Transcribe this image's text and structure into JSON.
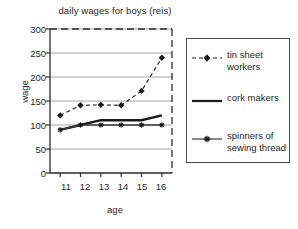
{
  "chart_data": {
    "type": "line",
    "title": "daily wages for boys (reis)",
    "xlabel": "age",
    "ylabel": "wage",
    "x": [
      11,
      12,
      13,
      14,
      15,
      16
    ],
    "xticklabels": [
      "11",
      "12",
      "13",
      "14",
      "15",
      "16"
    ],
    "yticklabels": [
      "0",
      "50",
      "100",
      "150",
      "200",
      "250",
      "300"
    ],
    "yticks": [
      0,
      50,
      100,
      150,
      200,
      250,
      300
    ],
    "xlim": [
      10.5,
      16.5
    ],
    "ylim": [
      0,
      300
    ],
    "grid": "horizontal",
    "legend_position": "right-outside",
    "series": [
      {
        "name": "tin sheet workers",
        "values": [
          120,
          141,
          142,
          141,
          171,
          240
        ],
        "linestyle": "dashed",
        "marker": "diamond",
        "color": "#1a1a1a"
      },
      {
        "name": "cork makers",
        "values": [
          90,
          100,
          110,
          110,
          110,
          120
        ],
        "linestyle": "solid",
        "marker": "none",
        "color": "#1a1a1a"
      },
      {
        "name": "spinners of sewing thread",
        "values": [
          90,
          100,
          100,
          100,
          100,
          100
        ],
        "linestyle": "solid",
        "marker": "star",
        "color": "#3a3a3a"
      }
    ]
  },
  "legend": {
    "entries": [
      {
        "label": "tin sheet workers"
      },
      {
        "label": "cork makers"
      },
      {
        "label": "spinners of sewing thread"
      }
    ]
  },
  "axis": {
    "y": {
      "t0": "300",
      "t1": "250",
      "t2": "200",
      "t3": "150",
      "t4": "100",
      "t5": "50",
      "t6": "0"
    },
    "x": {
      "t0": "11",
      "t1": "12",
      "t2": "13",
      "t3": "14",
      "t4": "15",
      "t5": "16"
    }
  },
  "colors": {
    "axis": "#2b2b2b",
    "grid": "#9a9a9a",
    "series_primary": "#1a1a1a",
    "series_spinners": "#3a3a3a",
    "background": "#ffffff"
  }
}
